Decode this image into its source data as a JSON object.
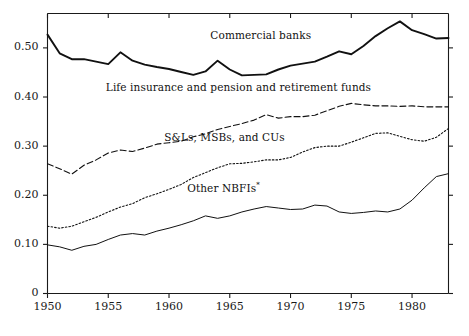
{
  "chart_data": {
    "type": "line",
    "title": "",
    "subtitle": "",
    "xlabel": "",
    "ylabel": "",
    "xlim": [
      1950,
      1983
    ],
    "ylim": [
      0,
      0.57
    ],
    "grid": false,
    "legend_position": "inline-annotations",
    "xticks": [
      1950,
      1955,
      1960,
      1965,
      1970,
      1975,
      1980
    ],
    "xtick_labels": [
      "1950",
      "1955",
      "1960",
      "1965",
      "1970",
      "1975",
      "1980"
    ],
    "yticks": [
      0,
      0.1,
      0.2,
      0.3,
      0.4,
      0.5
    ],
    "ytick_labels": [
      "0",
      "0.10",
      "0.20",
      "0.30",
      "0.40",
      "0.50"
    ],
    "x": [
      1950,
      1951,
      1952,
      1953,
      1954,
      1955,
      1956,
      1957,
      1958,
      1959,
      1960,
      1961,
      1962,
      1963,
      1964,
      1965,
      1966,
      1967,
      1968,
      1969,
      1970,
      1971,
      1972,
      1973,
      1974,
      1975,
      1976,
      1977,
      1978,
      1979,
      1980,
      1981,
      1982,
      1983
    ],
    "series": [
      {
        "name": "Commercial banks",
        "style": "solid-thick",
        "label_x": 1963.4,
        "label_y": 0.525,
        "values": [
          0.527,
          0.489,
          0.477,
          0.477,
          0.472,
          0.467,
          0.491,
          0.474,
          0.466,
          0.461,
          0.457,
          0.451,
          0.445,
          0.452,
          0.474,
          0.456,
          0.444,
          0.445,
          0.446,
          0.456,
          0.464,
          0.468,
          0.472,
          0.482,
          0.493,
          0.487,
          0.504,
          0.524,
          0.54,
          0.554,
          0.536,
          0.528,
          0.519,
          0.52
        ]
      },
      {
        "name": "Life insurance and pension and retirement funds",
        "style": "dashed",
        "label_x": 1954.8,
        "label_y": 0.418,
        "values": [
          0.264,
          0.254,
          0.243,
          0.261,
          0.272,
          0.286,
          0.292,
          0.289,
          0.296,
          0.304,
          0.307,
          0.31,
          0.319,
          0.325,
          0.334,
          0.34,
          0.346,
          0.353,
          0.364,
          0.357,
          0.36,
          0.36,
          0.363,
          0.372,
          0.381,
          0.387,
          0.384,
          0.382,
          0.382,
          0.381,
          0.382,
          0.38,
          0.38,
          0.38
        ]
      },
      {
        "name": "S&Ls, MSBs, and CUs",
        "style": "dotted",
        "label_x": 1959.6,
        "label_y": 0.317,
        "values": [
          0.137,
          0.133,
          0.137,
          0.146,
          0.155,
          0.166,
          0.176,
          0.183,
          0.195,
          0.203,
          0.212,
          0.222,
          0.236,
          0.246,
          0.256,
          0.264,
          0.265,
          0.268,
          0.272,
          0.272,
          0.277,
          0.288,
          0.297,
          0.3,
          0.3,
          0.308,
          0.317,
          0.326,
          0.327,
          0.32,
          0.313,
          0.31,
          0.318,
          0.336
        ]
      },
      {
        "name": "Other NBFIs*",
        "style": "solid-thin",
        "label_x": 1961.5,
        "label_y": 0.214,
        "values": [
          0.099,
          0.095,
          0.088,
          0.096,
          0.1,
          0.11,
          0.119,
          0.122,
          0.119,
          0.127,
          0.133,
          0.14,
          0.148,
          0.158,
          0.153,
          0.158,
          0.166,
          0.172,
          0.177,
          0.174,
          0.171,
          0.172,
          0.18,
          0.178,
          0.166,
          0.163,
          0.165,
          0.168,
          0.166,
          0.172,
          0.19,
          0.215,
          0.238,
          0.244
        ]
      }
    ]
  },
  "footnote": {
    "marker": "*"
  },
  "series_labels": {
    "commercial_banks": "Commercial banks",
    "life_insurance": "Life insurance and pension and retirement funds",
    "snls": "S&Ls, MSBs, and CUs",
    "other_nbfis": "Other NBFIs"
  }
}
